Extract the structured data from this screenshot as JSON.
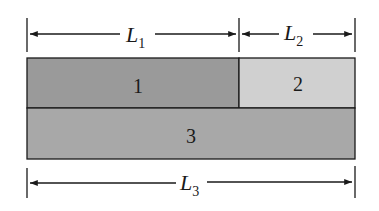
{
  "diagram": {
    "dimensions": [
      {
        "id": "L1",
        "symbol": "L",
        "subscript": "1"
      },
      {
        "id": "L2",
        "symbol": "L",
        "subscript": "2"
      },
      {
        "id": "L3",
        "symbol": "L",
        "subscript": "3"
      }
    ],
    "regions": [
      {
        "id": "1",
        "label": "1",
        "color": "#9a9a9a"
      },
      {
        "id": "2",
        "label": "2",
        "color": "#d0d0d0"
      },
      {
        "id": "3",
        "label": "3",
        "color": "#a8a8a8"
      }
    ]
  }
}
